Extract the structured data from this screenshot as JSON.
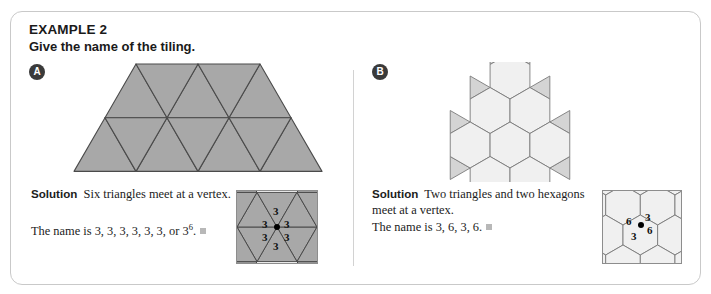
{
  "example": {
    "title": "EXAMPLE 2",
    "prompt": "Give the name of the tiling."
  },
  "parts": [
    {
      "badge": "A",
      "solution_label": "Solution",
      "solution_text": "Six triangles meet at a vertex.",
      "name_line_prefix": "The name is ",
      "name_line": "3, 3, 3, 3, 3, 3, or 3",
      "name_exponent": "6",
      "name_suffix": ".",
      "vertex_labels": [
        "3",
        "3",
        "3",
        "3",
        "3",
        "3"
      ]
    },
    {
      "badge": "B",
      "solution_label": "Solution",
      "solution_text": "Two triangles and two hexagons meet at a vertex.",
      "name_line_prefix": "The name is ",
      "name_line": "3, 6, 3, 6.",
      "name_exponent": "",
      "name_suffix": "",
      "vertex_labels": [
        "6",
        "3",
        "3",
        "6"
      ]
    }
  ],
  "colors": {
    "card_border": "#c9c9c9",
    "triangle_fill": "#a8a8a8",
    "triangle_stroke": "#4a4a4a",
    "hexagon_fill": "#f0f0f0",
    "kagome_triangle_fill": "#d4d4d4",
    "kagome_stroke": "#7a7a7a",
    "divider": "#d2d2d2",
    "badge_bg": "#3a3a3a",
    "endmark": "#b8b8b8",
    "text": "#1c1c1c"
  },
  "sol_a_line1_html": "Six triangles meet at a vertex.",
  "sol_b_line1_html": "Two triangles and two hexagons meet at a vertex."
}
